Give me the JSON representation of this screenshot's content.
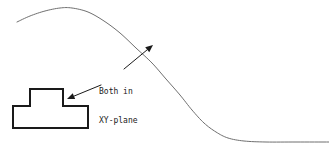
{
  "figure": {
    "background_color": "#ffffff",
    "width": 329,
    "height": 151
  },
  "annotation": {
    "line1": "Both in",
    "line2": "XY-plane",
    "text_color": "#1a1a1a",
    "font_size_px": 8
  },
  "curve": {
    "name": "hill-profile-curve",
    "stroke_color": "#6f6f6f",
    "stroke_width": 1,
    "description": "smooth S-shaped hill profile rising from left, peaking near x=70, descending steeply and flattening to the right",
    "points": [
      [
        17,
        22
      ],
      [
        30,
        16
      ],
      [
        45,
        11
      ],
      [
        60,
        8
      ],
      [
        72,
        8
      ],
      [
        88,
        12
      ],
      [
        104,
        21
      ],
      [
        120,
        33
      ],
      [
        136,
        48
      ],
      [
        152,
        63
      ],
      [
        166,
        79
      ],
      [
        180,
        95
      ],
      [
        192,
        110
      ],
      [
        204,
        123
      ],
      [
        216,
        132
      ],
      [
        228,
        138
      ],
      [
        244,
        141
      ],
      [
        266,
        142
      ],
      [
        296,
        142
      ],
      [
        329,
        142
      ]
    ]
  },
  "part_outline": {
    "name": "t-slot-part-outline",
    "stroke_color": "#1a1a1a",
    "stroke_width": 2,
    "fill_color": "#ffffff",
    "vertices": [
      [
        13,
        106
      ],
      [
        30,
        106
      ],
      [
        30,
        89
      ],
      [
        63,
        89
      ],
      [
        63,
        106
      ],
      [
        88,
        106
      ],
      [
        88,
        128
      ],
      [
        13,
        128
      ]
    ]
  },
  "arrows": [
    {
      "name": "arrow-to-curve",
      "from": [
        124,
        69
      ],
      "to": [
        153,
        45
      ],
      "color": "#1a1a1a",
      "stroke_width": 1
    },
    {
      "name": "arrow-to-part",
      "from": [
        101,
        85
      ],
      "to": [
        67,
        99
      ],
      "color": "#1a1a1a",
      "stroke_width": 1
    }
  ]
}
